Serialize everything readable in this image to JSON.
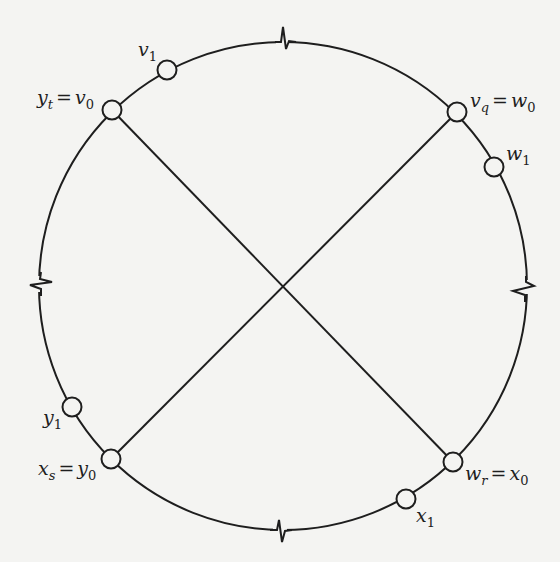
{
  "diagram": {
    "type": "cycle-with-crossing-chords",
    "stroke_color": "#1e1e1e",
    "background": "#f4f4f2",
    "circle": {
      "cx": 283,
      "cy": 286,
      "r": 244
    },
    "break_marks": [
      "top",
      "right",
      "bottom",
      "left"
    ],
    "nodes": [
      {
        "id": "v1",
        "x": 167,
        "y": 70
      },
      {
        "id": "yt_v0",
        "x": 112,
        "y": 110
      },
      {
        "id": "vq_w0",
        "x": 457,
        "y": 112
      },
      {
        "id": "w1",
        "x": 494,
        "y": 167
      },
      {
        "id": "y1",
        "x": 72,
        "y": 407
      },
      {
        "id": "xs_y0",
        "x": 111,
        "y": 459
      },
      {
        "id": "wr_x0",
        "x": 453,
        "y": 462
      },
      {
        "id": "x1",
        "x": 406,
        "y": 499
      }
    ],
    "chords": [
      {
        "from": "yt_v0",
        "to": "wr_x0"
      },
      {
        "from": "vq_w0",
        "to": "xs_y0"
      }
    ],
    "labels": {
      "v1": {
        "base": "v",
        "sub": "1"
      },
      "yt_v0": {
        "lhs_base": "y",
        "lhs_sub": "t",
        "eq": "=",
        "rhs_base": "v",
        "rhs_sub": "0"
      },
      "vq_w0": {
        "lhs_base": "v",
        "lhs_sub": "q",
        "eq": "=",
        "rhs_base": "w",
        "rhs_sub": "0"
      },
      "w1": {
        "base": "w",
        "sub": "1"
      },
      "y1": {
        "base": "y",
        "sub": "1"
      },
      "xs_y0": {
        "lhs_base": "x",
        "lhs_sub": "s",
        "eq": "=",
        "rhs_base": "y",
        "rhs_sub": "0"
      },
      "wr_x0": {
        "lhs_base": "w",
        "lhs_sub": "r",
        "eq": "=",
        "rhs_base": "x",
        "rhs_sub": "0"
      },
      "x1": {
        "base": "x",
        "sub": "1"
      }
    }
  }
}
